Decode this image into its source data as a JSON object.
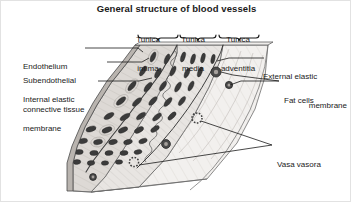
{
  "figure": {
    "title": "General structure of blood vessels",
    "type": "anatomical-diagram",
    "background_color": "#ffffff",
    "ink_color": "#1a1a1a"
  },
  "layer_labels": {
    "intima": {
      "line1": "Tunica",
      "line2": "intima"
    },
    "media": {
      "line1": "Tunica",
      "line2": "media"
    },
    "adventitia": {
      "line1": "Tunica",
      "line2": "adventitia"
    }
  },
  "left_labels": {
    "endothelium": {
      "line1": "Endothelium",
      "line2": ""
    },
    "subendothelial": {
      "line1": "Subendothelial",
      "line2": "connective tissue"
    },
    "internal_elastic": {
      "line1": "Internal elastic",
      "line2": "membrane"
    }
  },
  "right_labels": {
    "external_elastic": {
      "line1": "External elastic",
      "line2": "membrane"
    },
    "fat_cells": {
      "line1": "Fat cells",
      "line2": ""
    },
    "vasa_vasora": {
      "line1": "Vasa vasora",
      "line2": ""
    }
  },
  "structures": {
    "fat_cell_name": "fat-cell",
    "vasa_vasorum_name": "vasa-vasorum-vessel",
    "nucleus_name": "cell-nucleus",
    "brace_name": "layer-brace"
  },
  "colors": {
    "tissue_light": "#f0eeec",
    "tissue_mid": "#e3e0dd",
    "tissue_dark": "#d4d0cc",
    "nucleus": "#3a3a3a",
    "outline": "#4a4a4a",
    "leader": "#2b2b2b"
  }
}
